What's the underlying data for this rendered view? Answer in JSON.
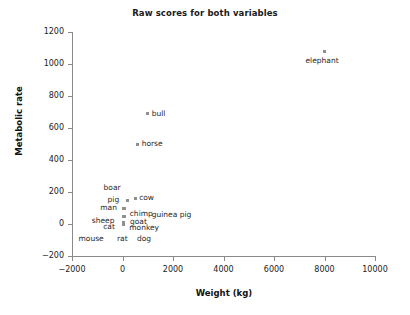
{
  "chart_data": {
    "type": "scatter",
    "title": "Raw scores for both variables",
    "xlabel": "Weight (kg)",
    "ylabel": "Metabolic rate",
    "xlim": [
      -2000,
      10000
    ],
    "ylim": [
      -200,
      1200
    ],
    "xticks": [
      "−2000",
      "0",
      "2000",
      "4000",
      "6000",
      "8000",
      "10000"
    ],
    "xtick_values": [
      -2000,
      0,
      2000,
      4000,
      6000,
      8000,
      10000
    ],
    "yticks": [
      "1200",
      "1000",
      "800",
      "600",
      "400",
      "200",
      "0",
      "−200"
    ],
    "ytick_values": [
      1200,
      1000,
      800,
      600,
      400,
      200,
      0,
      -200
    ],
    "grid": false,
    "legend": false,
    "marker_color": "#8f8f8f",
    "marker_shape": "square",
    "points": [
      {
        "label": "elephant",
        "x": 8000,
        "y": 1080,
        "label_pos": "below"
      },
      {
        "label": "bull",
        "x": 1000,
        "y": 690,
        "label_pos": "right"
      },
      {
        "label": "horse",
        "x": 600,
        "y": 500,
        "label_pos": "right"
      },
      {
        "label": "boar",
        "x": 200,
        "y": 150,
        "label_pos": "above-left"
      },
      {
        "label": "pig",
        "x": 200,
        "y": 150,
        "label_pos": "left"
      },
      {
        "label": "cow",
        "x": 500,
        "y": 160,
        "label_pos": "right"
      },
      {
        "label": "man",
        "x": 70,
        "y": 100,
        "label_pos": "left"
      },
      {
        "label": "chimp",
        "x": 50,
        "y": 95,
        "label_pos": "right"
      },
      {
        "label": "guinea pig",
        "x": 50,
        "y": 90,
        "label_pos": "right"
      },
      {
        "label": "sheep",
        "x": 50,
        "y": 50,
        "label_pos": "left"
      },
      {
        "label": "goat",
        "x": 60,
        "y": 45,
        "label_pos": "right"
      },
      {
        "label": "cat",
        "x": 30,
        "y": 10,
        "label_pos": "left"
      },
      {
        "label": "monkey",
        "x": 30,
        "y": 5,
        "label_pos": "right"
      },
      {
        "label": "mouse",
        "x": 0,
        "y": 0,
        "label_pos": "below-left"
      },
      {
        "label": "rat",
        "x": 20,
        "y": 0,
        "label_pos": "below"
      },
      {
        "label": "dog",
        "x": 100,
        "y": 0,
        "label_pos": "below-right"
      }
    ]
  },
  "chart": {
    "title": "Raw scores for both variables",
    "x_axis_title": "Weight (kg)",
    "y_axis_title": "Metabolic rate",
    "x_tick_labels": [
      "−2000",
      "0",
      "2000",
      "4000",
      "6000",
      "8000",
      "10000"
    ],
    "y_tick_labels": [
      "1200",
      "1000",
      "800",
      "600",
      "400",
      "200",
      "0",
      "−200"
    ],
    "point_labels": {
      "elephant": "elephant",
      "bull": "bull",
      "horse": "horse",
      "boar": "boar",
      "pig": "pig",
      "cow": "cow",
      "man": "man",
      "chimp": "chimp",
      "guinea_pig": "guinea pig",
      "sheep": "sheep",
      "goat": "goat",
      "cat": "cat",
      "monkey": "monkey",
      "mouse": "mouse",
      "rat": "rat",
      "dog": "dog"
    }
  }
}
